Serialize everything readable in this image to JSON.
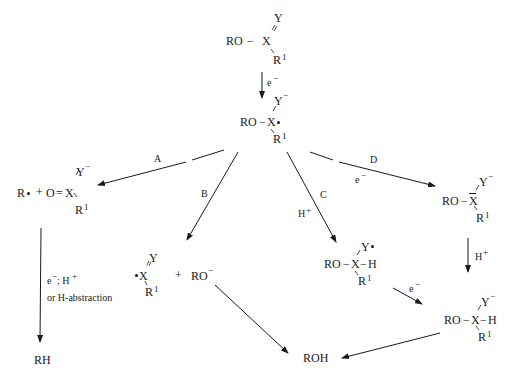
{
  "diagram": {
    "type": "reaction-scheme",
    "start": {
      "ro": "RO",
      "dash": "−",
      "x": "X",
      "y": "Y",
      "r": "R",
      "r_sup": "1",
      "double_bond": "="
    },
    "step1": {
      "arrow_label": "e",
      "arrow_label_sup": "−"
    },
    "radical_anion": {
      "ro": "RO",
      "dash": "−",
      "x": "X",
      "y": "Y",
      "y_sup": "−",
      "r": "R",
      "r_sup": "1"
    },
    "pathways": {
      "A": {
        "label": "A"
      },
      "B": {
        "label": "B"
      },
      "C": {
        "label": "C",
        "reagent": "H",
        "reagent_sup": "+"
      },
      "D": {
        "label": "D",
        "reagent": "e",
        "reagent_sup": "−"
      }
    },
    "product_A": {
      "radical": "R",
      "plus": "+",
      "o": "O",
      "eq": "=",
      "x": "X",
      "y": "Y",
      "y_sup": "−",
      "r": "R",
      "r_sup": "1"
    },
    "step_A_to_RH": {
      "line1": "e",
      "line1_sup": "−",
      "line1_rest": "; H",
      "line1_rest_sup": "+",
      "line2": "or H-abstraction"
    },
    "RH": {
      "label": "RH"
    },
    "product_B": {
      "x": "X",
      "y": "Y",
      "r": "R",
      "r_sup": "1",
      "plus": "+",
      "ro": "RO",
      "ro_sup": "−"
    },
    "product_C": {
      "ro": "RO",
      "dash": "−",
      "x": "X",
      "dash2": "−",
      "h": "H",
      "y": "Y",
      "r": "R",
      "r_sup": "1"
    },
    "product_D": {
      "ro": "RO",
      "dash": "−",
      "x": "X",
      "y": "Y",
      "y_sup": "−",
      "r": "R",
      "r_sup": "1"
    },
    "step_D_to_final": {
      "reagent": "H",
      "reagent_sup": "+"
    },
    "step_C_to_final": {
      "reagent": "e",
      "reagent_sup": "−"
    },
    "final_anion": {
      "ro": "RO",
      "dash": "−",
      "x": "X",
      "dash2": "−",
      "h": "H",
      "y": "Y",
      "y_sup": "−",
      "r": "R",
      "r_sup": "1"
    },
    "ROH": {
      "label": "ROH"
    }
  }
}
